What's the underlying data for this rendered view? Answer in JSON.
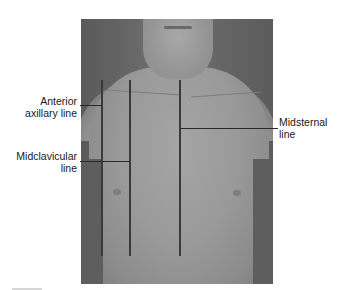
{
  "figure": {
    "labels": {
      "anterior_axillary": [
        "Anterior",
        "axillary line"
      ],
      "midclavicular": [
        "Midclavicular",
        "line"
      ],
      "midsternal": [
        "Midsternal",
        "line"
      ]
    },
    "colors": {
      "reference_line": "#3a3a3a",
      "text": "#1a1a1a",
      "background": "#ffffff"
    }
  }
}
